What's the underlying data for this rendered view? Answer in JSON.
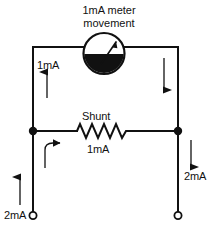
{
  "diagram": {
    "kind": "circuit-schematic",
    "title": {
      "line1": "1mA meter",
      "line2": "movement"
    },
    "colors": {
      "wire": "#111111",
      "text": "#111111",
      "background": "#ffffff",
      "meter_fill": "#111111"
    },
    "labels": {
      "left_branch_current": "1mA",
      "shunt_name": "Shunt",
      "shunt_current": "1mA",
      "input_terminal_current": "2mA",
      "output_terminal_current": "2mA"
    },
    "components": {
      "meter": {
        "name": "meter-movement",
        "shape": "circle-with-needle"
      },
      "shunt_resistor": {
        "name": "shunt-resistor",
        "shape": "zigzag",
        "peaks": 6
      },
      "junctions": [
        {
          "name": "left-junction",
          "x": 33,
          "y": 131
        },
        {
          "name": "right-junction",
          "x": 178,
          "y": 131
        }
      ],
      "terminals": [
        {
          "name": "input-terminal",
          "x": 33,
          "y": 215
        },
        {
          "name": "output-terminal",
          "x": 178,
          "y": 215
        }
      ]
    },
    "arrows": [
      {
        "name": "left-branch-current-arrow",
        "direction": "up"
      },
      {
        "name": "right-branch-current-arrow",
        "direction": "down"
      },
      {
        "name": "shunt-current-arrow",
        "direction": "curved-right"
      },
      {
        "name": "input-current-arrow",
        "direction": "up"
      },
      {
        "name": "output-current-arrow",
        "direction": "down"
      }
    ]
  }
}
